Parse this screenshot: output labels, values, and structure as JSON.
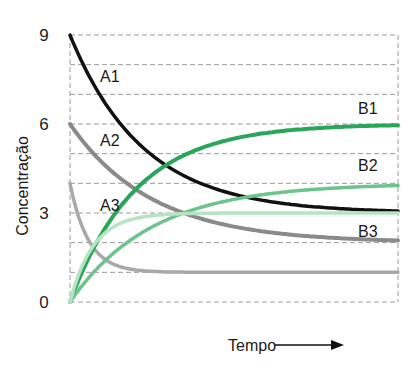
{
  "chart_data": {
    "type": "line",
    "title": "",
    "xlabel": "Tempo",
    "ylabel": "Concentração",
    "x_arrow": true,
    "ylim": [
      0,
      9
    ],
    "yticks": [
      0,
      3,
      6,
      9
    ],
    "grid": {
      "on": true,
      "style": "dashed",
      "y_step": 1
    },
    "legend": "inline labels",
    "x": [
      0,
      0.1,
      0.2,
      0.3,
      0.4,
      0.5,
      0.6,
      0.7,
      0.8,
      0.9,
      1.0
    ],
    "series": [
      {
        "name": "A1",
        "color": "#111111",
        "width": 3.5,
        "start": 9,
        "end": 3,
        "k": 4.5,
        "values": [
          9,
          6.8,
          5.4,
          4.5,
          3.8,
          3.4,
          3.2,
          3.1,
          3.05,
          3.0,
          3.0
        ]
      },
      {
        "name": "A2",
        "color": "#8a8a8a",
        "width": 4,
        "start": 6,
        "end": 2,
        "k": 4,
        "values": [
          6,
          4.7,
          3.8,
          3.2,
          2.8,
          2.5,
          2.4,
          2.2,
          2.2,
          2.1,
          2.0
        ]
      },
      {
        "name": "A3",
        "color": "#a8a8a8",
        "width": 3.5,
        "start": 4,
        "end": 1,
        "k": 18,
        "values": [
          4,
          1.5,
          1.1,
          1.0,
          1.0,
          1.0,
          1.0,
          1.0,
          1.0,
          1.0,
          1.0
        ]
      },
      {
        "name": "B1",
        "color": "#2aa65a",
        "width": 4,
        "start": 0,
        "end": 6,
        "k": 5,
        "values": [
          0,
          2.4,
          3.8,
          4.7,
          5.2,
          5.5,
          5.7,
          5.8,
          5.9,
          6.0,
          6.0
        ]
      },
      {
        "name": "B2",
        "color": "#6cc48c",
        "width": 3.5,
        "start": 0,
        "end": 4,
        "k": 4,
        "values": [
          0,
          1.3,
          2.2,
          2.8,
          3.2,
          3.5,
          3.6,
          3.8,
          3.8,
          3.9,
          4.0
        ]
      },
      {
        "name": "B3",
        "color": "#b5e3c4",
        "width": 3.5,
        "start": 0,
        "end": 3,
        "k": 14,
        "values": [
          0,
          2.3,
          2.8,
          3.0,
          3.0,
          3.0,
          3.0,
          3.0,
          3.0,
          3.0,
          3.0
        ]
      }
    ],
    "annotations": [
      {
        "text": "A1",
        "x": 100,
        "y": 82
      },
      {
        "text": "A2",
        "x": 100,
        "y": 146
      },
      {
        "text": "A3",
        "x": 100,
        "y": 211
      },
      {
        "text": "B1",
        "x": 358,
        "y": 114
      },
      {
        "text": "B2",
        "x": 358,
        "y": 171
      },
      {
        "text": "B3",
        "x": 358,
        "y": 237
      }
    ]
  },
  "axis": {
    "y_ticks": [
      {
        "label": "9",
        "value": 9
      },
      {
        "label": "6",
        "value": 6
      },
      {
        "label": "3",
        "value": 3
      },
      {
        "label": "0",
        "value": 0
      }
    ],
    "y_label": "Concentração",
    "x_label": "Tempo"
  }
}
